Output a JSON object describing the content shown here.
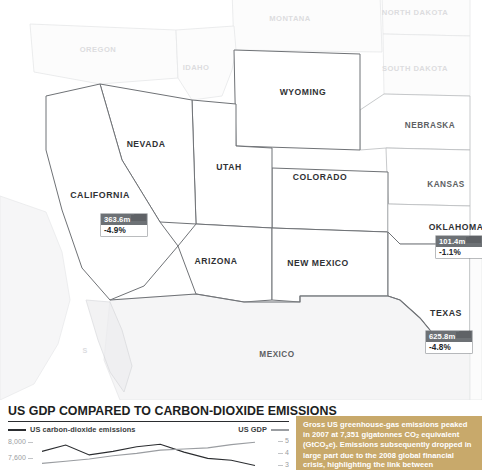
{
  "top_copy": "and shale gas proving a cheaper energy alternative, such efforts may have limited practical effect.",
  "map": {
    "states": [
      {
        "name": "MONTANA",
        "style": "faded",
        "x": 290,
        "y": 18,
        "size": 7.6
      },
      {
        "name": "NORTH DAKOTA",
        "style": "faded",
        "x": 415,
        "y": 12,
        "size": 7.6
      },
      {
        "name": "OREGON",
        "style": "faded",
        "x": 98,
        "y": 49,
        "size": 7.6
      },
      {
        "name": "IDAHO",
        "style": "faded",
        "x": 196,
        "y": 67,
        "size": 7.6
      },
      {
        "name": "SOUTH DAKOTA",
        "style": "faded",
        "x": 415,
        "y": 68,
        "size": 7.6
      },
      {
        "name": "WYOMING",
        "style": "dark",
        "x": 303,
        "y": 92,
        "size": 8.6
      },
      {
        "name": "NEBRASKA",
        "style": "mid",
        "x": 430,
        "y": 125,
        "size": 8.2
      },
      {
        "name": "NEVADA",
        "style": "dark",
        "x": 146,
        "y": 144,
        "size": 8.6
      },
      {
        "name": "UTAH",
        "style": "dark",
        "x": 229,
        "y": 167,
        "size": 8.6
      },
      {
        "name": "COLORADO",
        "style": "dark",
        "x": 320,
        "y": 177,
        "size": 8.6
      },
      {
        "name": "KANSAS",
        "style": "mid",
        "x": 446,
        "y": 184,
        "size": 8.2
      },
      {
        "name": "CALIFORNIA",
        "style": "dark",
        "x": 100,
        "y": 195,
        "size": 8.8
      },
      {
        "name": "OKLAHOMA",
        "style": "dark",
        "x": 456,
        "y": 227,
        "size": 8.6
      },
      {
        "name": "ARIZONA",
        "style": "dark",
        "x": 216,
        "y": 261,
        "size": 8.6
      },
      {
        "name": "NEW MEXICO",
        "style": "dark",
        "x": 318,
        "y": 263,
        "size": 8.6
      },
      {
        "name": "TEXAS",
        "style": "dark",
        "x": 446,
        "y": 313,
        "size": 8.8
      },
      {
        "name": "MEXICO",
        "style": "mid",
        "x": 277,
        "y": 354,
        "size": 8.2
      },
      {
        "name": "S",
        "style": "faded",
        "x": 85,
        "y": 350,
        "size": 7.2
      }
    ],
    "callouts": [
      {
        "state": "CALIFORNIA",
        "emissions": "363.6m",
        "change": "-4.9%",
        "x": 124,
        "y": 214
      },
      {
        "state": "OKLAHOMA",
        "emissions": "101.4m",
        "change": "-1.1%",
        "x": 459,
        "y": 236
      },
      {
        "state": "TEXAS",
        "emissions": "625.8m",
        "change": "-4.8%",
        "x": 449,
        "y": 331
      }
    ]
  },
  "chart_data": {
    "type": "line",
    "title": "US GDP COMPARED TO CARBON-DIOXIDE EMISSIONS",
    "xlabel": "",
    "ylabel": "",
    "grid": false,
    "legend_position": "top",
    "series": [
      {
        "name": "US carbon-dioxide emissions",
        "axis": "left",
        "color": "#2b2d30",
        "x": [
          1990,
          1993,
          1996,
          1999,
          2002,
          2005,
          2008,
          2011,
          2014,
          2017
        ],
        "values": [
          7700,
          7880,
          7600,
          7700,
          7830,
          7900,
          7680,
          7500,
          7450,
          7300
        ]
      },
      {
        "name": "US GDP",
        "axis": "right",
        "color": "#9a9da1",
        "x": [
          1990,
          1993,
          1996,
          1999,
          2002,
          2005,
          2008,
          2011,
          2014,
          2017
        ],
        "values": [
          3.1,
          3.3,
          3.5,
          3.8,
          4.0,
          4.3,
          4.4,
          4.5,
          4.8,
          5.0
        ]
      }
    ],
    "left_axis": {
      "label": "",
      "ticks": [
        "8,000",
        "7,600"
      ],
      "values": [
        8000,
        7600
      ]
    },
    "right_axis": {
      "label": "",
      "ticks": [
        "5",
        "4",
        "3"
      ],
      "values": [
        5,
        4,
        3
      ]
    },
    "legend": [
      {
        "label": "US carbon-dioxide emissions",
        "swatch": "dark-line",
        "side": "left"
      },
      {
        "label": "US GDP",
        "swatch": "gray-line",
        "side": "right"
      }
    ]
  },
  "caption": {
    "line_1": "Gross US greenhouse-gas emissions peaked",
    "line_2_a": "in 2007 at 7,351 gigatonnes CO",
    "line_2_sub": "2",
    "line_2_b": " equivalent",
    "line_3_a": "(GtCO",
    "line_3_sub": "2",
    "line_3_b": "e). Emissions subsequently dropped",
    "line_4": "in large part due to the 2008 global financial",
    "line_5": "crisis, highlighting the link between"
  },
  "colors": {
    "caption_panel": "#c8a96b",
    "callout_bar": "#6d7175",
    "emissions_line": "#2b2d30",
    "gdp_line": "#9a9da1",
    "state_label_dark": "#2f3134",
    "state_label_faded": "#dcdcdf"
  }
}
